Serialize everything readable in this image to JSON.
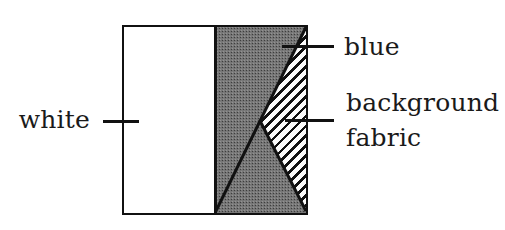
{
  "figure": {
    "type": "labeled-diagram",
    "labels": {
      "white": "white",
      "blue": "blue",
      "background_fabric": "background fabric"
    },
    "regions": [
      {
        "name": "white",
        "fill_style": "solid-white"
      },
      {
        "name": "blue",
        "fill_style": "halftone-gray"
      },
      {
        "name": "background fabric",
        "fill_style": "diagonal-hatch"
      }
    ],
    "colors": {
      "line": "#111111",
      "halftone_gray": "#9a9a9a",
      "hatch_stripe": "#101010",
      "background": "#ffffff",
      "text": "#1a1a1a"
    }
  }
}
